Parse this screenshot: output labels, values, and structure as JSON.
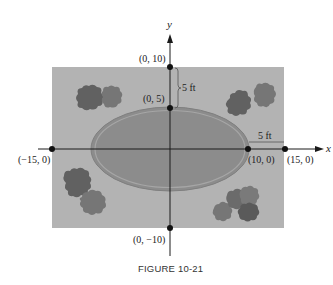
{
  "figure": {
    "caption": "FIGURE 10-21",
    "axes": {
      "x_label": "x",
      "y_label": "y"
    },
    "points": [
      {
        "label": "(0, 10)",
        "x": 0,
        "y": 10
      },
      {
        "label": "(0, 5)",
        "x": 0,
        "y": 5
      },
      {
        "label": "(−15, 0)",
        "x": -15,
        "y": 0
      },
      {
        "label": "(10, 0)",
        "x": 10,
        "y": 0
      },
      {
        "label": "(15, 0)",
        "x": 15,
        "y": 0
      },
      {
        "label": "(0, −10)",
        "x": 0,
        "y": -10
      }
    ],
    "dimensions": [
      {
        "label": "5 ft",
        "orientation": "vertical",
        "between": "(0, 5)-(0, 10)"
      },
      {
        "label": "5 ft",
        "orientation": "horizontal",
        "between": "(10, 0)-(15, 0)"
      }
    ],
    "shapes": {
      "rectangle": {
        "x_range": [
          -15,
          15
        ],
        "y_range": [
          -10,
          10
        ],
        "fill": "#b3b3b3"
      },
      "ellipse": {
        "center": [
          0,
          0
        ],
        "a": 10,
        "b": 5,
        "fill": "#8c8c8c"
      },
      "bushes": [
        "top-left",
        "top-right",
        "bottom-left",
        "bottom-right"
      ]
    },
    "colors": {
      "background": "#ffffff",
      "lawn": "#b3b3b3",
      "pool": "#8c8c8c",
      "pool_rim": "#a8a8a8",
      "bush_dark": "#616161",
      "bush_mid": "#767676",
      "axis": "#1a1a1a"
    }
  }
}
